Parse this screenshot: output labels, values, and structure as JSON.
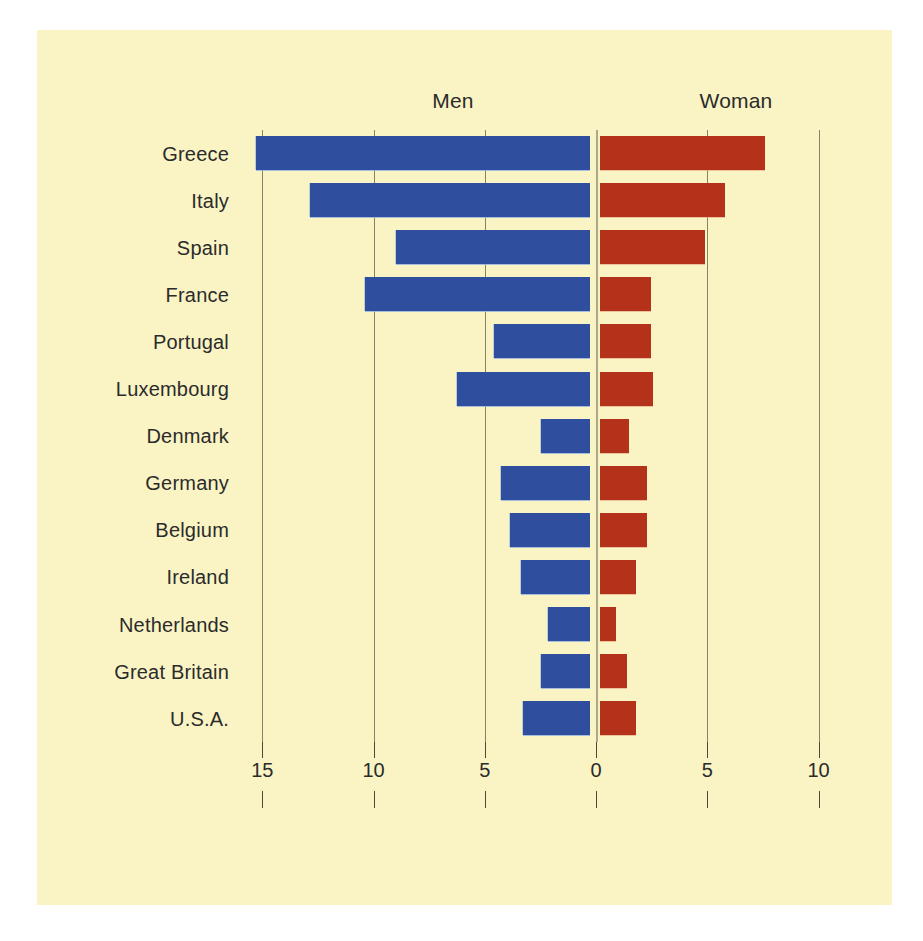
{
  "chart_data": {
    "type": "bar",
    "orientation": "horizontal",
    "style": "diverging-bidirectional",
    "title": "",
    "subtitle": "",
    "xlabel": "",
    "ylabel": "",
    "grid": true,
    "legend_position": "top",
    "categories": [
      "Greece",
      "Italy",
      "Spain",
      "France",
      "Portugal",
      "Luxembourg",
      "Denmark",
      "Germany",
      "Belgium",
      "Ireland",
      "Netherlands",
      "Great Britain",
      "U.S.A."
    ],
    "series": [
      {
        "name": "Men",
        "direction": "left",
        "color": "#2f4e9e",
        "values": [
          15.0,
          12.6,
          8.7,
          10.1,
          4.3,
          6.0,
          2.2,
          4.0,
          3.6,
          3.1,
          1.9,
          2.2,
          3.0
        ]
      },
      {
        "name": "Woman",
        "direction": "right",
        "color": "#b4321a",
        "values": [
          7.4,
          5.6,
          4.7,
          2.3,
          2.3,
          2.4,
          1.3,
          2.1,
          2.1,
          1.6,
          0.7,
          1.2,
          1.6
        ]
      }
    ],
    "axis": {
      "tick_labels": [
        "15",
        "10",
        "5",
        "0",
        "5",
        "10"
      ],
      "tick_values": [
        -15,
        -10,
        -5,
        0,
        5,
        10
      ],
      "xlim": [
        -16.5,
        11.5
      ],
      "left_max": 15,
      "right_max": 10
    },
    "colors": {
      "background": "#faf4c4",
      "page": "#ffffff",
      "men": "#2f4e9e",
      "woman": "#b4321a",
      "gridline": "#6d6f55",
      "text": "#2b2b2b"
    }
  },
  "headers": {
    "men": "Men",
    "woman": "Woman"
  }
}
